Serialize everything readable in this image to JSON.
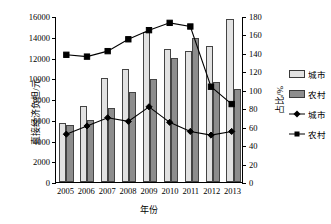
{
  "chart_data": {
    "type": "bar",
    "title": "",
    "xlabel": "年份",
    "ylabel": "直接经济负担/元",
    "ylabel_secondary": "占比/%",
    "categories": [
      "2005",
      "2006",
      "2007",
      "2008",
      "2009",
      "2010",
      "2011",
      "2012",
      "2013"
    ],
    "ylim": [
      0,
      16000
    ],
    "ylim_secondary": [
      0,
      180
    ],
    "yticks": [
      "0",
      "2000",
      "4000",
      "6000",
      "8000",
      "10000",
      "12000",
      "14000",
      "16000"
    ],
    "yticks_secondary": [
      "0",
      "20",
      "40",
      "60",
      "80",
      "100",
      "120",
      "140",
      "160",
      "180"
    ],
    "grid": false,
    "legend_position": "right",
    "series": [
      {
        "name": "城市",
        "kind": "bar",
        "axis": "left",
        "color": "#e2e2e2",
        "values": [
          5650,
          7300,
          10050,
          10900,
          14450,
          12850,
          12650,
          13150,
          15700
        ]
      },
      {
        "name": "农村",
        "kind": "bar",
        "axis": "left",
        "color": "#8d8d8d",
        "values": [
          5450,
          6000,
          7100,
          8650,
          9950,
          11950,
          13900,
          9600,
          9000
        ]
      },
      {
        "name": "城市",
        "kind": "line",
        "axis": "right",
        "marker": "diamond",
        "color": "#000000",
        "values": [
          52,
          61,
          70,
          66,
          82,
          65,
          55,
          51,
          55
        ]
      },
      {
        "name": "农村",
        "kind": "line",
        "axis": "right",
        "marker": "square",
        "color": "#000000",
        "values": [
          139,
          137,
          143,
          156,
          166,
          174,
          170,
          104,
          85
        ]
      }
    ]
  },
  "legend": {
    "items": [
      {
        "label": "城市",
        "type": "bar-light"
      },
      {
        "label": "农村",
        "type": "bar-dark"
      },
      {
        "label": "城市",
        "type": "line-diamond"
      },
      {
        "label": "农村",
        "type": "line-square"
      }
    ]
  }
}
